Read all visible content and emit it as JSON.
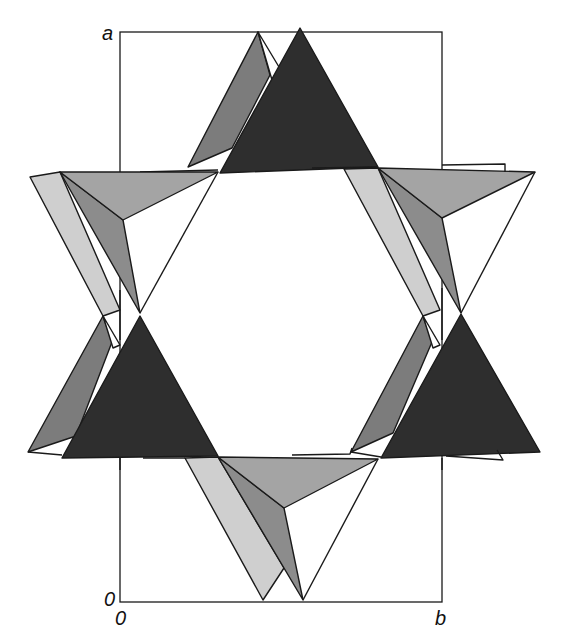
{
  "figure": {
    "axes": {
      "vertical_axis_label": "a",
      "origin_label_left": "0",
      "origin_label_bottom": "0",
      "horizontal_axis_label": "b"
    },
    "colors": {
      "dark": "#2e2e2e",
      "medium": "#7c7c7c",
      "light_medium": "#a4a4a4",
      "light": "#cfcfcf",
      "edge": "#1a1a1a",
      "background": "#ffffff"
    },
    "tetrahedra_groups": [
      {
        "name": "top",
        "position": "top-center"
      },
      {
        "name": "upper-left",
        "position": "upper-left"
      },
      {
        "name": "upper-right",
        "position": "upper-right"
      },
      {
        "name": "lower-left",
        "position": "middle-left"
      },
      {
        "name": "lower-right",
        "position": "middle-right"
      },
      {
        "name": "bottom",
        "position": "bottom-center"
      }
    ]
  }
}
